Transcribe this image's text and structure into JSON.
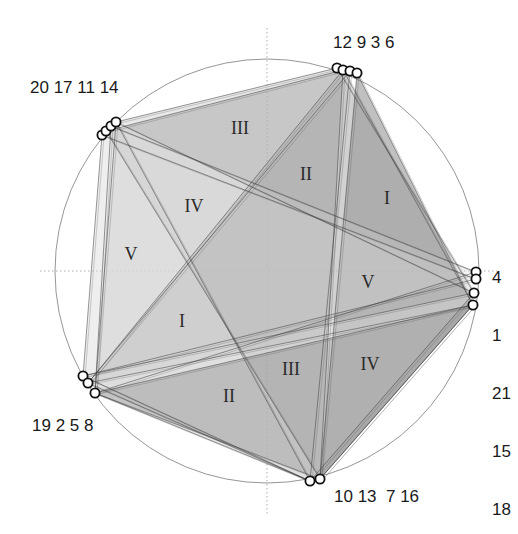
{
  "diagram": {
    "title": "",
    "circle": {
      "cx": 267,
      "cy": 271,
      "r": 212,
      "stroke": "#8a8a8a"
    },
    "axes": {
      "horizontal_y": 271,
      "vertical_x": 267,
      "stroke": "#9a9a9a",
      "style": "dotted"
    },
    "clusters": [
      {
        "id": "top",
        "label": "12 9 3 6",
        "label_x": 333,
        "label_y": 34,
        "points": [
          [
            337,
            68
          ],
          [
            343,
            70
          ],
          [
            350,
            71
          ],
          [
            357,
            73
          ]
        ]
      },
      {
        "id": "right",
        "label_lines": [
          "4",
          "1",
          "21",
          "15",
          "18"
        ],
        "label_x": 492,
        "label_y": 232,
        "points": [
          [
            476,
            272
          ],
          [
            476,
            279
          ],
          [
            474,
            293
          ],
          [
            473,
            305
          ]
        ]
      },
      {
        "id": "bottom",
        "label": "10 13  7 16",
        "label_x": 334,
        "label_y": 488,
        "points": [
          [
            310,
            481
          ],
          [
            320,
            479
          ]
        ]
      },
      {
        "id": "lower-left",
        "label": "19 2 5 8",
        "label_x": 32,
        "label_y": 417,
        "points": [
          [
            83,
            376
          ],
          [
            88,
            383
          ],
          [
            95,
            393
          ]
        ]
      },
      {
        "id": "upper-left",
        "label": "20 17 11 14",
        "label_x": 30,
        "label_y": 79,
        "points": [
          [
            102,
            135
          ],
          [
            106,
            131
          ],
          [
            111,
            126
          ],
          [
            116,
            122
          ]
        ]
      }
    ],
    "triangles": [
      {
        "name": "III",
        "pts": [
          [
            116,
            122
          ],
          [
            337,
            68
          ],
          [
            474,
            293
          ]
        ],
        "fill": "#d6d6d6",
        "opacity": 0.55
      },
      {
        "name": "II",
        "pts": [
          [
            350,
            71
          ],
          [
            310,
            481
          ],
          [
            88,
            383
          ]
        ],
        "fill": "#cfcfcf",
        "opacity": 0.35
      },
      {
        "name": "I",
        "pts": [
          [
            357,
            73
          ],
          [
            473,
            305
          ],
          [
            320,
            479
          ]
        ],
        "fill": "#8c8c8c",
        "opacity": 0.55
      },
      {
        "name": "IV",
        "pts": [
          [
            106,
            131
          ],
          [
            320,
            479
          ],
          [
            343,
            70
          ]
        ],
        "fill": "#8a8a8a",
        "opacity": 0.35
      },
      {
        "name": "V",
        "pts": [
          [
            102,
            135
          ],
          [
            83,
            376
          ],
          [
            476,
            279
          ]
        ],
        "fill": "#d9d9d9",
        "opacity": 0.45
      },
      {
        "name": "V",
        "pts": [
          [
            476,
            272
          ],
          [
            111,
            126
          ],
          [
            95,
            393
          ]
        ],
        "fill": "#dcdcdc",
        "opacity": 0.35
      },
      {
        "name": "I",
        "pts": [
          [
            88,
            383
          ],
          [
            343,
            70
          ],
          [
            473,
            305
          ]
        ],
        "fill": "#9b9b9b",
        "opacity": 0.3
      },
      {
        "name": "II",
        "pts": [
          [
            95,
            393
          ],
          [
            310,
            481
          ],
          [
            116,
            122
          ]
        ],
        "fill": "#d3d3d3",
        "opacity": 0.45
      },
      {
        "name": "III",
        "pts": [
          [
            310,
            481
          ],
          [
            474,
            293
          ],
          [
            83,
            376
          ]
        ],
        "fill": "#dedede",
        "opacity": 0.4
      },
      {
        "name": "IV",
        "pts": [
          [
            320,
            479
          ],
          [
            473,
            305
          ],
          [
            95,
            393
          ]
        ],
        "fill": "#7c7c7c",
        "opacity": 0.35
      }
    ],
    "region_labels": [
      {
        "text": "III",
        "x": 240,
        "y": 130
      },
      {
        "text": "II",
        "x": 306,
        "y": 176
      },
      {
        "text": "I",
        "x": 387,
        "y": 200
      },
      {
        "text": "IV",
        "x": 194,
        "y": 208
      },
      {
        "text": "V",
        "x": 131,
        "y": 256
      },
      {
        "text": "V",
        "x": 368,
        "y": 284
      },
      {
        "text": "I",
        "x": 182,
        "y": 323
      },
      {
        "text": "II",
        "x": 229,
        "y": 398
      },
      {
        "text": "III",
        "x": 291,
        "y": 371
      },
      {
        "text": "IV",
        "x": 370,
        "y": 366
      }
    ],
    "colors": {
      "line": "#3a3a3a",
      "marker_stroke": "#111111",
      "marker_fill": "#ffffff"
    }
  }
}
